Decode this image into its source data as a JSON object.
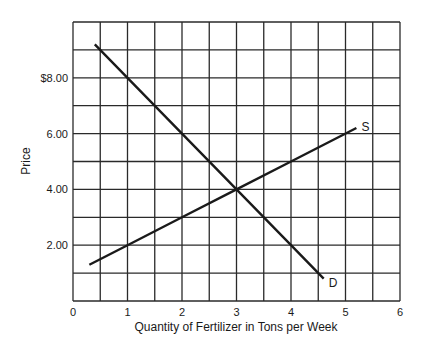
{
  "chart_data": {
    "type": "line",
    "title": "",
    "xlabel": "Quantity of Fertilizer in Tons per Week",
    "ylabel": "Price",
    "xlim": [
      0,
      6
    ],
    "ylim": [
      0,
      10
    ],
    "grid": true,
    "grid_x_step": 0.5,
    "grid_y_step": 1,
    "x_ticks": [
      {
        "value": 0,
        "label": "0"
      },
      {
        "value": 1,
        "label": "1"
      },
      {
        "value": 2,
        "label": "2"
      },
      {
        "value": 3,
        "label": "3"
      },
      {
        "value": 4,
        "label": "4"
      },
      {
        "value": 5,
        "label": "5"
      },
      {
        "value": 6,
        "label": "6"
      }
    ],
    "y_ticks": [
      {
        "value": 2,
        "label": "2.00"
      },
      {
        "value": 4,
        "label": "4.00"
      },
      {
        "value": 6,
        "label": "6.00"
      },
      {
        "value": 8,
        "label": "$8.00"
      }
    ],
    "series": [
      {
        "name": "D",
        "label": "D",
        "description": "Demand",
        "points": [
          [
            0.4,
            9.2
          ],
          [
            1,
            8
          ],
          [
            2,
            6
          ],
          [
            3,
            4
          ],
          [
            4,
            2
          ],
          [
            4.6,
            0.8
          ]
        ]
      },
      {
        "name": "S",
        "label": "S",
        "description": "Supply",
        "points": [
          [
            0.3,
            1.3
          ],
          [
            1,
            2
          ],
          [
            2,
            3
          ],
          [
            3,
            4
          ],
          [
            4,
            5
          ],
          [
            5.2,
            6.2
          ]
        ]
      }
    ],
    "equilibrium": {
      "quantity": 3,
      "price": 4
    },
    "legend": "none (curves labeled inline: S, D)"
  },
  "colors": {
    "background": "#ffffff",
    "ink": "#1a1a1a",
    "grid": "#2a2a2a"
  }
}
